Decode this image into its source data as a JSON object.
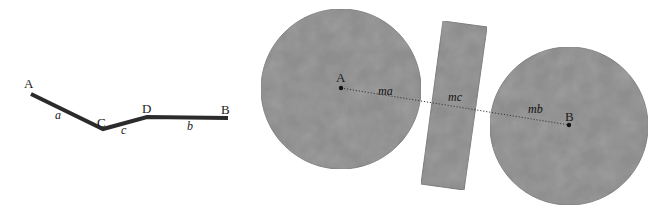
{
  "colors": {
    "background": "#ffffff",
    "polyline": "#2b2b2b",
    "shape_fill": "#8e8e8e",
    "shape_blotch": "#7c7c7c",
    "shape_edge": "#7a7a7a",
    "dotted_line": "#3a3a3a",
    "point_dot": "#111111",
    "label_text": "#1a1a1a"
  },
  "left_figure": {
    "description": "bent polyline A-C-D-B",
    "points": {
      "A": {
        "label": "A",
        "x": 31,
        "y": 94
      },
      "C": {
        "label": "C",
        "x": 103,
        "y": 129
      },
      "D": {
        "label": "D",
        "x": 147,
        "y": 117
      },
      "B": {
        "label": "B",
        "x": 228,
        "y": 118
      }
    },
    "segments": {
      "a": {
        "label": "a",
        "from": "A",
        "to": "C"
      },
      "c": {
        "label": "c",
        "from": "C",
        "to": "D"
      },
      "b": {
        "label": "b",
        "from": "D",
        "to": "B"
      }
    },
    "labels": {
      "A": "A",
      "C": "C",
      "D": "D",
      "B": "B",
      "a": "a",
      "c": "c",
      "b": "b"
    }
  },
  "right_figure": {
    "description": "two disks joined through a tilted rectangle by a dotted line",
    "disk_A": {
      "label": "A",
      "cx": 341,
      "cy": 89,
      "r": 80
    },
    "rod": {
      "corners": [
        [
          443,
          21
        ],
        [
          487,
          27
        ],
        [
          464,
          190
        ],
        [
          421,
          184
        ]
      ]
    },
    "disk_B": {
      "label": "B",
      "cx": 569,
      "cy": 126,
      "r": 79
    },
    "center_A": {
      "x": 341,
      "y": 88
    },
    "center_B": {
      "x": 569,
      "y": 125
    },
    "labels": {
      "A": "A",
      "B": "B",
      "ma": "ma",
      "mc": "mc",
      "mb": "mb"
    }
  }
}
